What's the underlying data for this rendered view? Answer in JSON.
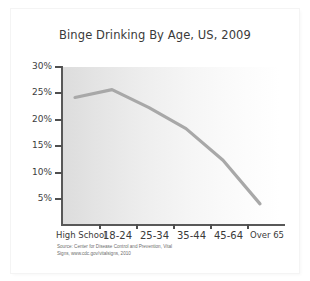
{
  "chart_data": {
    "type": "line",
    "title": "Binge Drinking By Age, US, 2009",
    "xlabel": "",
    "ylabel": "",
    "categories": [
      "High School",
      "18-24",
      "25-34",
      "35-44",
      "45-64",
      "Over 65"
    ],
    "values": [
      24.2,
      25.7,
      22.3,
      18.3,
      12.3,
      4.0
    ],
    "series": [
      {
        "name": "Binge drinking prevalence",
        "values": [
          24.2,
          25.7,
          22.3,
          18.3,
          12.3,
          4.0
        ]
      }
    ],
    "ylim": [
      0,
      30
    ],
    "yticks": [
      30,
      25,
      20,
      15,
      10,
      5
    ],
    "ytick_labels": [
      "30%",
      "25%",
      "20%",
      "15%",
      "10%",
      "5%"
    ],
    "grid": false,
    "legend": "none",
    "line_color": "#a8a8a8",
    "axis_color": "#585858",
    "plot_background": "gray-to-white horizontal gradient"
  },
  "source": {
    "line1": "Source: Center for Disease Control and Prevention, Vital",
    "line2": "Signs, www.cdc.gov/vitalsigns, 2010"
  }
}
